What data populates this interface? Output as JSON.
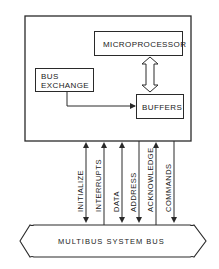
{
  "diagram": {
    "board": {
      "blocks": {
        "microprocessor": "MICROPROCESSOR",
        "bus_exchange_line1": "BUS",
        "bus_exchange_line2": "EXCHANGE",
        "buffers": "BUFFERS"
      }
    },
    "signals": [
      {
        "label": "INITIALIZE",
        "direction": "bidirectional"
      },
      {
        "label": "INTERRUPTS",
        "direction": "to-board"
      },
      {
        "label": "DATA",
        "direction": "bidirectional"
      },
      {
        "label": "ADDRESS",
        "direction": "to-bus"
      },
      {
        "label": "ACKNOWLEDGE",
        "direction": "to-board"
      },
      {
        "label": "COMMANDS",
        "direction": "to-bus"
      }
    ],
    "bus": {
      "label": "MULTIBUS SYSTEM BUS"
    },
    "colors": {
      "line": "#2a2a2a",
      "background": "#ffffff"
    }
  }
}
